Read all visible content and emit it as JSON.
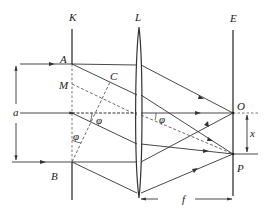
{
  "diagram": {
    "type": "optics-diffraction-geometry",
    "colors": {
      "line": "#333333",
      "dashed": "#444444",
      "background": "#ffffff"
    },
    "labels": {
      "K": "K",
      "L": "L",
      "E": "E",
      "A": "A",
      "B": "B",
      "M": "M",
      "C": "C",
      "O": "O",
      "P": "P",
      "a": "a",
      "x": "x",
      "f": "f",
      "phi": "φ"
    },
    "elements": [
      {
        "id": "slit-plane",
        "label": "K"
      },
      {
        "id": "lens",
        "label": "L"
      },
      {
        "id": "screen",
        "label": "E"
      }
    ],
    "dimensions": [
      {
        "id": "slit-width",
        "label": "a",
        "between": [
          "A",
          "B"
        ]
      },
      {
        "id": "focal-length",
        "label": "f",
        "between": [
          "L",
          "E"
        ]
      },
      {
        "id": "offset",
        "label": "x",
        "between": [
          "O",
          "P"
        ]
      }
    ],
    "angles": [
      {
        "label": "φ",
        "location": "between axis and inclined ray"
      },
      {
        "label": "φ",
        "location": "between AB and BC"
      },
      {
        "label": "φ",
        "location": "between axis and dashed line to P after lens"
      }
    ]
  }
}
